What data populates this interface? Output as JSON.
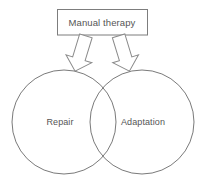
{
  "diagram": {
    "title": "Manual therapy",
    "type": "venn-diagram-with-source-box",
    "source_box": {
      "label": "Manual therapy",
      "border_color": "#7d7d7d",
      "fill_color": "#ffffff"
    },
    "arrows": [
      {
        "name": "arrow-to-repair",
        "direction": "down-left",
        "glyph": "block-arrow-down"
      },
      {
        "name": "arrow-to-adaptation",
        "direction": "down-right",
        "glyph": "block-arrow-down"
      }
    ],
    "circles": [
      {
        "label": "Repair",
        "position": "left",
        "stroke_color": "#7a7a7a"
      },
      {
        "label": "Adaptation",
        "position": "right",
        "stroke_color": "#7a7a7a"
      }
    ],
    "text_color": "#555555",
    "background_color": "#ffffff"
  }
}
